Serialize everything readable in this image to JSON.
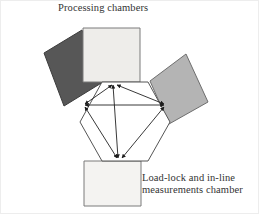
{
  "figure": {
    "kind": "cluster-tool-schematic",
    "background_color": "#ffffff",
    "outline_color": "#555555",
    "arrow_color": "#222222",
    "frame_color": "#e9e9e9",
    "labels": {
      "top": "Processing chambers",
      "bottom": "Load-lock and in-line\nmeasurements chamber"
    },
    "central_chamber": {
      "name": "transfer-chamber",
      "shape": "hexagon",
      "fill": "#ffffff",
      "stroke": "#555555",
      "points": "102,82 148,82 170,122 148,161 102,161 80,122"
    },
    "chambers": [
      {
        "id": "top-chamber",
        "label_group": "Processing chambers",
        "fill": "#eeedea",
        "stroke": "#7a7a7a",
        "points": "83,28 140,28 140,82 83,82"
      },
      {
        "id": "left-chamber",
        "label_group": "Processing chambers",
        "fill": "#575757",
        "stroke": "#3c3c3c",
        "points": "44,53 82,30 103,82 64,106"
      },
      {
        "id": "right-chamber",
        "label_group": "Processing chambers",
        "fill": "#b4b4b4",
        "stroke": "#6e6e6e",
        "points": "150,81 186,54 208,102 169,124"
      },
      {
        "id": "bottom-chamber",
        "label_group": "Load-lock and in-line measurements chamber",
        "fill": "#f4f3f1",
        "stroke": "#7a7a7a",
        "points": "84,161 141,161 141,206 84,206"
      }
    ],
    "transfer_paths": [
      {
        "id": "path-top-to-bottom",
        "from": "top-port",
        "to": "bottom-port",
        "x1": 113,
        "y1": 85,
        "x2": 118,
        "y2": 158
      },
      {
        "id": "path-left-to-right",
        "from": "left-port",
        "to": "right-port",
        "x1": 85,
        "y1": 105,
        "x2": 164,
        "y2": 105
      },
      {
        "id": "path-left-to-top",
        "from": "left-port",
        "to": "top-port",
        "x1": 85,
        "y1": 104,
        "x2": 112,
        "y2": 85
      },
      {
        "id": "path-right-to-top",
        "from": "right-port",
        "to": "top-port",
        "x1": 164,
        "y1": 104,
        "x2": 117,
        "y2": 85
      },
      {
        "id": "path-left-to-bottom",
        "from": "left-port",
        "to": "bottom-port",
        "x1": 85,
        "y1": 107,
        "x2": 117,
        "y2": 158
      },
      {
        "id": "path-right-to-bottom",
        "from": "right-port",
        "to": "bottom-port",
        "x1": 164,
        "y1": 107,
        "x2": 122,
        "y2": 158
      }
    ]
  }
}
